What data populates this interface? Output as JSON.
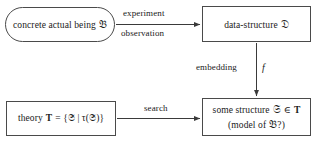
{
  "diagram": {
    "background_color": "#ffffff",
    "line_color": "#4a4a4a",
    "text_color": "#1a1a1a"
  },
  "nodes": {
    "being": {
      "shape": "rounded-rectangle",
      "text": "concrete actual being",
      "symbol": "𝔅"
    },
    "data_structure": {
      "shape": "rectangle",
      "text": "data-structure",
      "symbol": "𝔇"
    },
    "theory": {
      "shape": "rectangle",
      "text": "theory",
      "symbol_t": "T",
      "formula": "= {𝔖 | τ(𝔖)}"
    },
    "structure": {
      "shape": "rectangle",
      "line1_prefix": "some structure",
      "line1_symbol": "𝔖",
      "line1_relation": "∈",
      "line1_theory": "T",
      "line2_prefix": "(model of",
      "line2_symbol": "𝔅",
      "line2_suffix": "?)"
    }
  },
  "edges": {
    "experiment": {
      "label_top": "experiment",
      "label_bottom": "observation",
      "direction": "right"
    },
    "embedding": {
      "label": "embedding",
      "map_symbol": "f",
      "direction": "down"
    },
    "search": {
      "label": "search",
      "direction": "right"
    }
  }
}
